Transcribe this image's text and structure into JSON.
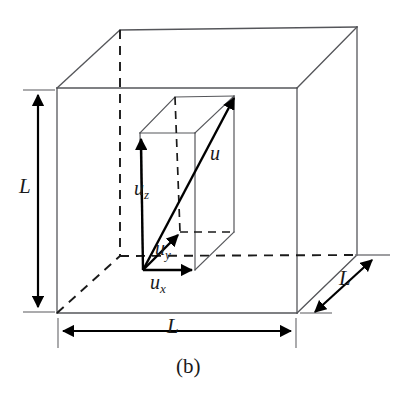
{
  "figure": {
    "caption": "(b)",
    "caption_position": {
      "x": 182,
      "y": 356
    },
    "background_color": "#ffffff",
    "solid_edge_color": "#55565a",
    "hidden_edge_color": "#1a1a1a",
    "vector_color": "#000000",
    "dimension_color": "#000000",
    "text_color": "#1a1a1a",
    "width": 403,
    "height": 394
  },
  "outer_cube": {
    "name": "cubic-container",
    "edge_label": "L",
    "front_face": {
      "top_left": {
        "x": 57,
        "y": 88
      },
      "top_right": {
        "x": 297,
        "y": 88
      },
      "bottom_right": {
        "x": 297,
        "y": 313
      },
      "bottom_left": {
        "x": 57,
        "y": 313
      }
    },
    "back_face": {
      "top_left": {
        "x": 120,
        "y": 30
      },
      "top_right": {
        "x": 357,
        "y": 27
      },
      "bottom_right": {
        "x": 357,
        "y": 255
      },
      "bottom_left": {
        "x": 120,
        "y": 255
      }
    },
    "hidden_edges": [
      "back-left-vertical",
      "back-bottom-horizontal",
      "bottom-left-depth-diagonal"
    ]
  },
  "inner_prism": {
    "name": "component-box",
    "front_face": {
      "top_left": {
        "x": 140,
        "y": 133
      },
      "top_right": {
        "x": 195,
        "y": 133
      },
      "bottom_right": {
        "x": 195,
        "y": 270
      },
      "bottom_left": {
        "x": 143,
        "y": 270
      }
    },
    "back_face": {
      "top_left": {
        "x": 175,
        "y": 97
      },
      "top_right": {
        "x": 234,
        "y": 96
      },
      "bottom_right": {
        "x": 234,
        "y": 232
      },
      "bottom_left": {
        "x": 180,
        "y": 232
      }
    }
  },
  "vectors": {
    "origin": {
      "x": 143,
      "y": 270
    },
    "items": [
      {
        "id": "u",
        "label": "u",
        "subscript": "",
        "tip": {
          "x": 236,
          "y": 96
        },
        "label_position": {
          "x": 212,
          "y": 145
        }
      },
      {
        "id": "uz",
        "label": "u",
        "subscript": "z",
        "tip": {
          "x": 141,
          "y": 136
        },
        "label_position": {
          "x": 141,
          "y": 185
        }
      },
      {
        "id": "uy",
        "label": "u",
        "subscript": "y",
        "tip": {
          "x": 180,
          "y": 232
        },
        "label_position": {
          "x": 159,
          "y": 245
        }
      },
      {
        "id": "ux",
        "label": "u",
        "subscript": "x",
        "tip": {
          "x": 195,
          "y": 270
        },
        "label_position": {
          "x": 152,
          "y": 277
        }
      }
    ]
  },
  "dimensions": [
    {
      "id": "height-L",
      "label": "L",
      "orientation": "vertical",
      "from": {
        "x": 38,
        "y": 90
      },
      "to": {
        "x": 38,
        "y": 311
      },
      "label_position": {
        "x": 21,
        "y": 188
      },
      "tick_from": {
        "x1": 23,
        "y1": 90,
        "x2": 55,
        "y2": 90
      },
      "tick_to": {
        "x1": 23,
        "y1": 312,
        "x2": 55,
        "y2": 312
      }
    },
    {
      "id": "width-L",
      "label": "L",
      "orientation": "horizontal",
      "from": {
        "x": 59,
        "y": 330
      },
      "to": {
        "x": 295,
        "y": 330
      },
      "label_position": {
        "x": 168,
        "y": 318
      },
      "tick_from": {
        "x1": 58,
        "y1": 318,
        "x2": 58,
        "y2": 348
      },
      "tick_to": {
        "x1": 296,
        "y1": 318,
        "x2": 296,
        "y2": 348
      }
    },
    {
      "id": "depth-L",
      "label": "L",
      "orientation": "diagonal",
      "from": {
        "x": 312,
        "y": 315
      },
      "to": {
        "x": 375,
        "y": 257
      },
      "label_position": {
        "x": 342,
        "y": 275
      },
      "tick_from": {
        "x1": 300,
        "y1": 313,
        "x2": 330,
        "y2": 313
      },
      "tick_to": {
        "x1": 355,
        "y1": 255,
        "x2": 388,
        "y2": 255
      }
    }
  ]
}
